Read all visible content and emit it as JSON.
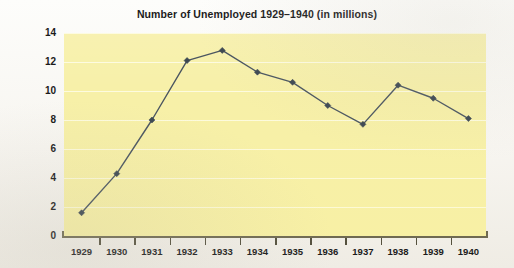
{
  "chart_data": {
    "type": "line",
    "title": "Number of Unemployed 1929–1940 (in millions)",
    "xlabel": "",
    "ylabel": "",
    "categories": [
      "1929",
      "1930",
      "1931",
      "1932",
      "1933",
      "1934",
      "1935",
      "1936",
      "1937",
      "1938",
      "1939",
      "1940"
    ],
    "values": [
      1.6,
      4.3,
      8.0,
      12.1,
      12.8,
      11.3,
      10.6,
      9.0,
      7.7,
      10.4,
      9.5,
      8.1
    ],
    "series": [
      {
        "name": "Unemployed (millions)",
        "values": [
          1.6,
          4.3,
          8.0,
          12.1,
          12.8,
          11.3,
          10.6,
          9.0,
          7.7,
          10.4,
          9.5,
          8.1
        ]
      }
    ],
    "ylim": [
      0,
      14
    ],
    "yticks": [
      0,
      2,
      4,
      6,
      8,
      10,
      12,
      14
    ],
    "ytick_labels": [
      "0",
      "2",
      "4",
      "6",
      "8",
      "10",
      "12",
      "14"
    ],
    "xtick_labels": [
      "1929",
      "1930",
      "1931",
      "1932",
      "1933",
      "1934",
      "1935",
      "1936",
      "1937",
      "1938",
      "1939",
      "1940"
    ],
    "grid": true,
    "grid_axis": "y",
    "legend": false,
    "legend_position": "none",
    "marker": "diamond",
    "colors": {
      "plot_background": "#f7f0a8",
      "page_background": "#fbfaf7",
      "line": "#4a5560",
      "marker": "#3d4852",
      "gridline": "#fdfbe2",
      "axis": "#6f6a52",
      "text": "#1b1b1b"
    }
  }
}
